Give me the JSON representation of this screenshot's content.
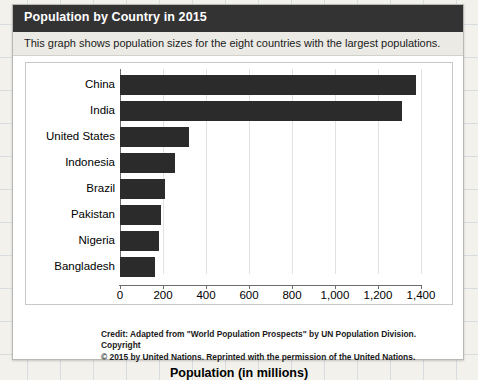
{
  "header": {
    "title": "Population by Country in 2015"
  },
  "subtitle": {
    "text": "This graph shows population sizes for the eight countries with the largest populations."
  },
  "credit": {
    "label": "Credit:",
    "line1": " Adapted from \"World Population Prospects\" by UN Population Division. Copyright",
    "line2": "© 2015 by United Nations. Reprinted with the permission of the United Nations."
  },
  "colors": {
    "header_bg": "#333333",
    "subtitle_bg": "#eceae5",
    "bar": "#2b2b2b",
    "gridline": "#e2e2e0",
    "axis": "#6e6e6e",
    "page_bg": "#f2f1ec"
  },
  "chart_data": {
    "type": "bar",
    "orientation": "horizontal",
    "title": "Population by Country in 2015",
    "subtitle": "This graph shows population sizes for the eight countries with the largest populations.",
    "xlabel": "Population (in millions)",
    "ylabel": "",
    "categories": [
      "China",
      "India",
      "United States",
      "Indonesia",
      "Brazil",
      "Pakistan",
      "Nigeria",
      "Bangladesh"
    ],
    "values": [
      1376,
      1311,
      322,
      258,
      208,
      189,
      182,
      161
    ],
    "xlim": [
      0,
      1400
    ],
    "xticks": [
      0,
      200,
      400,
      600,
      800,
      1000,
      1200,
      1400
    ],
    "xticklabels": [
      "0",
      "200",
      "400",
      "600",
      "800",
      "1,000",
      "1,200",
      "1,400"
    ],
    "grid": true,
    "grid_axis": "x",
    "legend": false,
    "legend_position": "none",
    "series": [
      {
        "name": "Population (in millions)",
        "color": "#2b2b2b",
        "values": [
          1376,
          1311,
          322,
          258,
          208,
          189,
          182,
          161
        ]
      }
    ]
  }
}
